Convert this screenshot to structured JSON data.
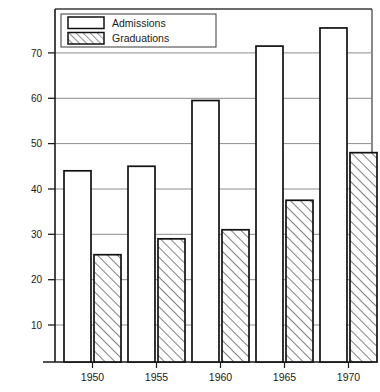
{
  "chart_data": {
    "type": "bar",
    "title": "",
    "subtitle": "",
    "xlabel": "",
    "ylabel": "",
    "categories": [
      "1950",
      "1955",
      "1960",
      "1965",
      "1970"
    ],
    "series": [
      {
        "name": "Admissions",
        "pattern": "solid-outline",
        "values": [
          44,
          45,
          59.5,
          71.5,
          75.5
        ]
      },
      {
        "name": "Graduations",
        "pattern": "diagonal-hatch",
        "values": [
          25.5,
          29,
          31,
          37.5,
          48
        ]
      }
    ],
    "ylim": [
      0,
      78
    ],
    "y_ticks": [
      "10",
      "20",
      "30",
      "40",
      "50",
      "60",
      "70"
    ],
    "y_tick_values": [
      10,
      20,
      30,
      40,
      50,
      60,
      70
    ],
    "x_ticks": [
      "1950",
      "1955",
      "1960",
      "1965",
      "1970"
    ],
    "grid": true,
    "grid_axis": "y",
    "legend_position": "top-left",
    "legend_entries": [
      "Admissions",
      "Graduations"
    ],
    "colors": {
      "axis": "#1a1a1a",
      "grid": "#8a8a8a",
      "bar_outline": "#111111",
      "bar_fill": "#ffffff",
      "hatch": "#555555",
      "frame": "#3a3a3a",
      "background": "#ffffff"
    }
  },
  "legend": {
    "items": [
      {
        "label": "Admissions",
        "swatch": "empty-swatch"
      },
      {
        "label": "Graduations",
        "swatch": "hatched-swatch"
      }
    ]
  },
  "axes": {
    "y_labels": [
      "70",
      "60",
      "50",
      "40",
      "30",
      "20",
      "10"
    ],
    "x_labels": [
      "1950",
      "1955",
      "1960",
      "1965",
      "1970"
    ]
  }
}
